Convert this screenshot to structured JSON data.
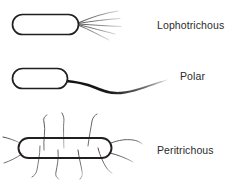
{
  "diagram": {
    "background_color": "#ffffff",
    "body_outline_color": "#231f20",
    "flagella_color": "#3a3a3a",
    "label_color": "#2b2b2b",
    "labels": {
      "lophotrichous": "Lophotrichous",
      "polar": "Polar",
      "peritrichous": "Peritrichous"
    },
    "specimens": [
      {
        "name": "lophotrichous",
        "label": "Lophotrichous",
        "flagella_count": 5,
        "flagella_placement": "tuft at one pole",
        "body_shape": "rounded-rectangle"
      },
      {
        "name": "polar",
        "label": "Polar",
        "flagella_count": 1,
        "flagella_placement": "single thick flagellum at one pole",
        "body_shape": "rounded-rectangle"
      },
      {
        "name": "peritrichous",
        "label": "Peritrichous",
        "flagella_count": 11,
        "flagella_placement": "distributed over entire surface",
        "body_shape": "rounded-rectangle"
      }
    ]
  }
}
